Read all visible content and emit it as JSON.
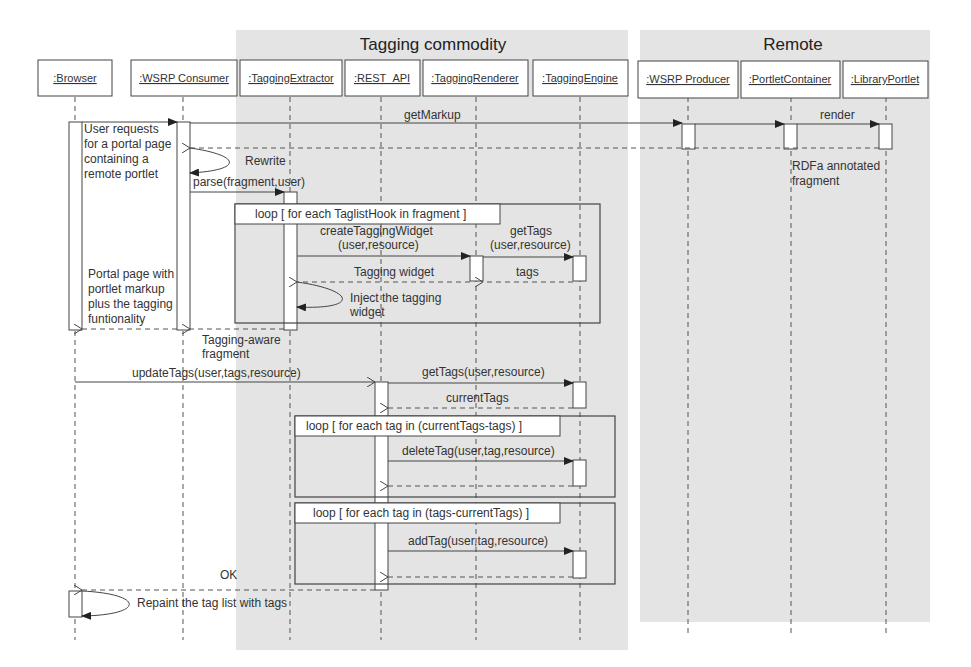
{
  "regions": {
    "tagging_commodity": "Tagging commodity",
    "remote": "Remote"
  },
  "lifelines": [
    {
      "label": ":Browser"
    },
    {
      "label": ":WSRP Consumer"
    },
    {
      "label": ":TaggingExtractor"
    },
    {
      "label": ":REST_API"
    },
    {
      "label": ":TaggingRenderer"
    },
    {
      "label": ":TaggingEngine"
    },
    {
      "label": ":WSRP Producer"
    },
    {
      "label": ":PortletContainer"
    },
    {
      "label": ":LibraryPortlet"
    }
  ],
  "notes": {
    "user_request": [
      "User requests",
      "for a portal page",
      "containing a",
      "remote portlet"
    ],
    "portal_page": [
      "Portal page with",
      "portlet markup",
      "plus the tagging",
      "funtionality"
    ],
    "tagging_aware": [
      "Tagging-aware",
      "fragment"
    ],
    "rdfa": [
      "RDFa annotated",
      "fragment"
    ],
    "inject": [
      "Inject the tagging",
      "widget"
    ]
  },
  "messages": {
    "getMarkup": "getMarkup",
    "render": "render",
    "rewrite": "Rewrite",
    "parse": "parse(fragment,user)",
    "createTaggingWidget_1": "createTaggingWidget",
    "createTaggingWidget_2": "(user,resource)",
    "getTags_1": "getTags",
    "getTags_2": "(user,resource)",
    "tagging_widget": "Tagging widget",
    "tags": "tags",
    "updateTags": "updateTags(user,tags,resource)",
    "getTags_full": "getTags(user,resource)",
    "currentTags": "currentTags",
    "deleteTag": "deleteTag(user,tag,resource)",
    "addTag": "addTag(user,tag,resource)",
    "ok": "OK",
    "repaint": "Repaint the tag list with tags"
  },
  "loops": {
    "taglist": "loop [ for each TaglistHook in fragment ]",
    "delete": "loop [ for each tag in (currentTags-tags)  ]",
    "add": "loop [ for each tag in (tags-currentTags)  ]"
  }
}
